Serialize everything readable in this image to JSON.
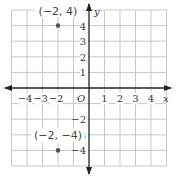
{
  "graph": {
    "x_axis_label": "x",
    "y_axis_label": "y",
    "origin_label": "O",
    "x_ticks": [
      {
        "value": -4,
        "label": "−4"
      },
      {
        "value": -3,
        "label": "−3"
      },
      {
        "value": -2,
        "label": "−2"
      },
      {
        "value": 1,
        "label": "1"
      },
      {
        "value": 2,
        "label": "2"
      },
      {
        "value": 3,
        "label": "3"
      },
      {
        "value": 4,
        "label": "4"
      }
    ],
    "y_ticks": [
      {
        "value": 4,
        "label": "4"
      },
      {
        "value": 3,
        "label": "3"
      },
      {
        "value": 2,
        "label": "2"
      },
      {
        "value": 1,
        "label": "1"
      },
      {
        "value": -2,
        "label": "−2"
      },
      {
        "value": -3,
        "label": "−3"
      },
      {
        "value": -4,
        "label": "−4"
      }
    ],
    "points": [
      {
        "x": -2,
        "y": 4,
        "label": "(−2, 4)"
      },
      {
        "x": -2,
        "y": -4,
        "label": "(−2, −4)"
      }
    ],
    "grid_range": {
      "x": [
        -5,
        5
      ],
      "y": [
        -5,
        5
      ]
    },
    "colors": {
      "grid": "#c8c8c8",
      "axis": "#222222",
      "point": "#555555"
    }
  }
}
